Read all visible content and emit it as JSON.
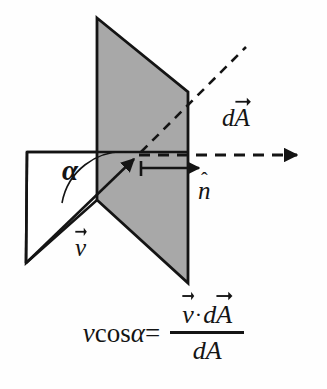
{
  "figure": {
    "colors": {
      "plane_fill": "#a8a8a8",
      "plane_stroke": "#141414",
      "line": "#141414",
      "background": "#ffffff",
      "white_plane_fill": "#ffffff"
    },
    "labels": {
      "angle": "α",
      "velocity_symbol": "v",
      "area_symbol": "dA",
      "area_symbol_d": "d",
      "area_symbol_A": "A",
      "normal_symbol": "n",
      "normal_hat": "ˆ"
    },
    "shapes": {
      "tilted_plane_points": "97,18 188,92 188,283 97,200",
      "horizontal_plane_points": "27,152 188,152 97,200 26,263",
      "horizontal_edge": {
        "x1": 27,
        "y1": 152,
        "x2": 188,
        "y2": 152
      },
      "velocity_line": {
        "x1": 26,
        "y1": 263,
        "x2": 138,
        "y2": 155
      },
      "dashed_horizontal_ray": {
        "x1": 138,
        "y1": 155,
        "x2": 303,
        "y2": 155
      },
      "dashed_diagonal_ray": {
        "x1": 140,
        "y1": 153,
        "x2": 246,
        "y2": 47
      },
      "normal_arrow": {
        "x1": 141,
        "y1": 168,
        "x2": 206,
        "y2": 168
      },
      "angle_arc": "M 131 152 A 58 58 0 0 0 66 202"
    }
  },
  "formula": {
    "lhs_v": "v",
    "lhs_cos": "cos",
    "lhs_alpha": "α",
    "equals": "=",
    "numerator_v": "v",
    "numerator_dot": "·",
    "numerator_d": "d",
    "numerator_A": "A",
    "denominator": "dA",
    "plain_text": "v cos α = (v⃗ · dA⃗) / dA"
  }
}
